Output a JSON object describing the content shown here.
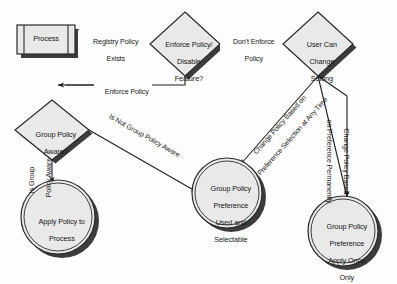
{
  "diagram": {
    "background": "#fdfdfd",
    "shape_fill": "#e9e9e9",
    "shape_stroke": "#2b2b2b",
    "shadow_color": "#3a3a3a",
    "line_color": "#1f1f1f",
    "text_color": "#161616"
  },
  "nodes": {
    "process": {
      "type": "predefined-process",
      "label": "Process"
    },
    "enforce_decision": {
      "type": "decision",
      "line1": "Enforce Policy/",
      "line2": "Disable",
      "line3": "Feature?"
    },
    "user_can_change": {
      "type": "decision",
      "line1": "User Can",
      "line2": "Change",
      "line3": "Setting"
    },
    "gp_aware": {
      "type": "decision",
      "line1": "Group Policy",
      "line2": "Aware?"
    },
    "apply_policy": {
      "type": "terminator",
      "line1": "Apply Policy to",
      "line2": "Process"
    },
    "gp_pref_selectable": {
      "type": "terminator",
      "line1": "Group Policy",
      "line2": "Preference",
      "line3": "Used and",
      "line4": "Selectable"
    },
    "gp_pref_once": {
      "type": "terminator",
      "line1": "Group Policy",
      "line2": "Preference",
      "line3": "Apply Once",
      "line4": "Only"
    }
  },
  "edges": {
    "registry_policy_exists": {
      "line1": "Registry Policy",
      "line2": "Exists"
    },
    "dont_enforce_policy": {
      "line1": "Don't Enforce",
      "line2": "Policy"
    },
    "enforce_policy": {
      "line1": "Enforce Policy"
    },
    "is_not_gp_aware": {
      "line1": "Is Not Group Policy Aware"
    },
    "is_gp_aware": {
      "line1": "Is Group",
      "line2": "Policy Aware"
    },
    "change_policy_any_time": {
      "line1": "Change Policy Based on",
      "line2": "Preference Selection at Any Time"
    },
    "change_policy_permanently": {
      "line1": "Change Policy Based",
      "line2": "on Preference Permanently"
    }
  }
}
